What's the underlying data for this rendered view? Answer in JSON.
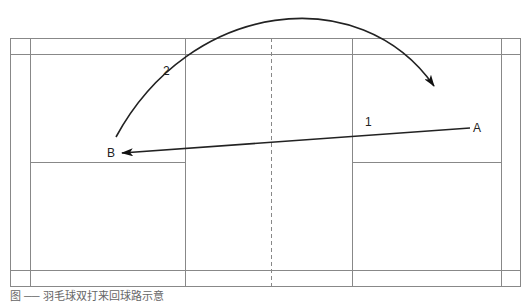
{
  "diagram": {
    "type": "badminton court shot diagram",
    "points": {
      "A": {
        "label": "A",
        "x": 478,
        "y": 128
      },
      "B": {
        "label": "B",
        "x": 116,
        "y": 153
      }
    },
    "shots": [
      {
        "number": "1",
        "from": "A",
        "to": "B",
        "kind": "straight drive"
      },
      {
        "number": "2",
        "from": "B",
        "to": "A",
        "kind": "high clear arc"
      }
    ],
    "court": {
      "outer": [
        10,
        38,
        520,
        286
      ],
      "net_x": 271
    }
  },
  "caption": "图 ── 羽毛球双打来回球路示意"
}
